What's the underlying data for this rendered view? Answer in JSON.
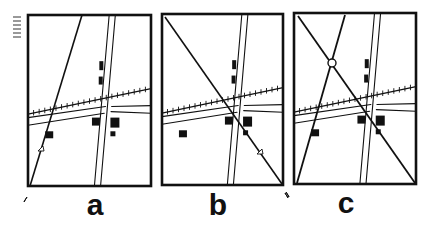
{
  "figure": {
    "ink_color": "#111111",
    "background": "#ffffff"
  },
  "signature_mark": "illegible handwritten initials (rotated)",
  "panels": [
    {
      "id": "a",
      "label": "a",
      "frame": {
        "x1": 28,
        "y1": 15,
        "x2": 151,
        "y2": 186
      },
      "label_pos": {
        "x": 95,
        "y": 192
      },
      "corner_arrow": {
        "x": 24,
        "y": 197,
        "dir": "up-right"
      },
      "sight_lines": [
        {
          "x1": 30,
          "y1": 186,
          "x2": 82,
          "y2": 15,
          "width": 1.6,
          "marker": {
            "x": 41,
            "y": 148
          }
        }
      ],
      "intersection_circle": null
    },
    {
      "id": "b",
      "label": "b",
      "frame": {
        "x1": 162,
        "y1": 14,
        "x2": 283,
        "y2": 185
      },
      "label_pos": {
        "x": 217,
        "y": 192
      },
      "corner_arrow": {
        "x": 288,
        "y": 193,
        "dir": "up-left"
      },
      "sight_lines": [
        {
          "x1": 165,
          "y1": 17,
          "x2": 282,
          "y2": 184,
          "width": 1.6,
          "marker": {
            "x": 260,
            "y": 151
          }
        }
      ],
      "intersection_circle": null
    },
    {
      "id": "c",
      "label": "c",
      "frame": {
        "x1": 294,
        "y1": 13,
        "x2": 416,
        "y2": 184
      },
      "label_pos": {
        "x": 345,
        "y": 190
      },
      "corner_arrow": {
        "x": 289,
        "y": 192,
        "dir": "up-left"
      },
      "sight_lines": [
        {
          "x1": 297,
          "y1": 183,
          "x2": 345,
          "y2": 15,
          "width": 1.8,
          "marker": null
        },
        {
          "x1": 298,
          "y1": 16,
          "x2": 415,
          "y2": 183,
          "width": 1.8,
          "marker": null
        }
      ],
      "intersection_circle": {
        "x": 332,
        "y": 63,
        "r": 4
      }
    }
  ]
}
